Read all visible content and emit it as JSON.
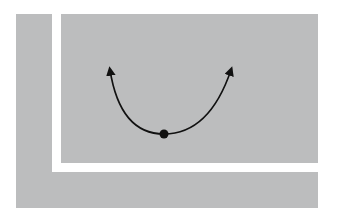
{
  "diagram": {
    "colors": {
      "panel": "#bcbdbe",
      "background": "#ffffff",
      "curve": "#111111",
      "ball": "#111111"
    },
    "curve": {
      "shape": "parabola-convex",
      "left_end": [
        110,
        67
      ],
      "right_end": [
        232,
        67
      ],
      "minimum": [
        164,
        134
      ],
      "arrowheads": "both-ends"
    },
    "ball": {
      "position": [
        164,
        134
      ],
      "radius": 4.5
    }
  }
}
